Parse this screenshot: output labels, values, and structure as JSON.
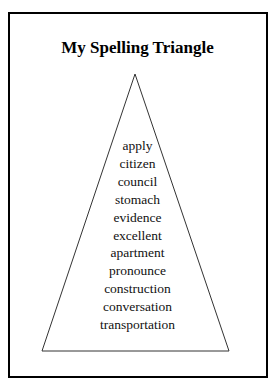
{
  "title": "My Spelling Triangle",
  "words": [
    "apply",
    "citizen",
    "council",
    "stomach",
    "evidence",
    "excellent",
    "apartment",
    "pronounce",
    "construction",
    "conversation",
    "transportation"
  ]
}
